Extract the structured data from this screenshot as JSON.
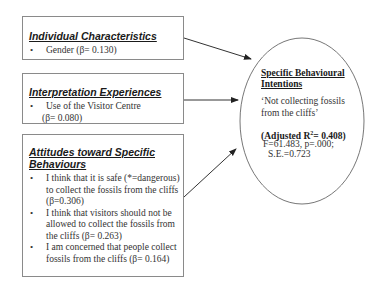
{
  "boxes": [
    {
      "title": "Individual Characteristics",
      "items": [
        "Gender (β= 0.130)"
      ]
    },
    {
      "title": "Interpretation Experiences",
      "items": [
        "Use of the Visitor Centre",
        "(β= 0.080)"
      ]
    },
    {
      "title_line1": "Attitudes toward Specific",
      "title_line2": "Behaviours",
      "items": [
        [
          "I think that it is safe (*=dangerous)",
          "to collect the fossils from the cliffs",
          "(β=0.306)"
        ],
        [
          "I think that visitors should not be",
          "allowed to collect the fossils from",
          "the cliffs (β= 0.263)"
        ],
        [
          "I am concerned that people collect",
          "fossils from the cliffs (β= 0.164)"
        ]
      ]
    }
  ],
  "outcome": {
    "title_line1": "Specific Behavioural",
    "title_line2": "Intentions",
    "quote_line1": "‘Not collecting fossils",
    "quote_line2": "from the cliffs’",
    "adjusted_prefix": "(Adjusted R",
    "adjusted_sup": "2",
    "adjusted_suffix": "= 0.408)",
    "stats_line1": "F=61.483, p=.000;",
    "stats_line2": "S.E.=0.723"
  },
  "bullet_glyph": "•"
}
